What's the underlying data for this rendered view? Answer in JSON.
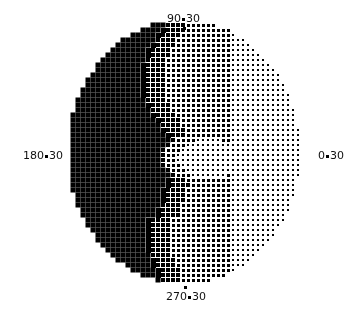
{
  "plot": {
    "type": "visual-field-greyscale",
    "center": [
      184,
      152
    ],
    "radius_x": 116,
    "radius_y": 132,
    "cell": 5,
    "colors": {
      "background": "#ffffff",
      "ink": "#000000"
    }
  },
  "labels": {
    "top": {
      "left": "90",
      "right": "30"
    },
    "left": {
      "left": "180",
      "right": "30"
    },
    "right": {
      "left": "0",
      "right": "30"
    },
    "bottom": {
      "left": "270",
      "right": "30"
    }
  },
  "density_field": {
    "description": "Darkness 0..1; dense black left hemifield, bright central oval, lighter right periphery",
    "base_left": 1.0,
    "base_right": 0.28,
    "bright_spot": {
      "cx": 208,
      "cy": 158,
      "rx": 32,
      "ry": 20,
      "value": 0.15
    }
  }
}
